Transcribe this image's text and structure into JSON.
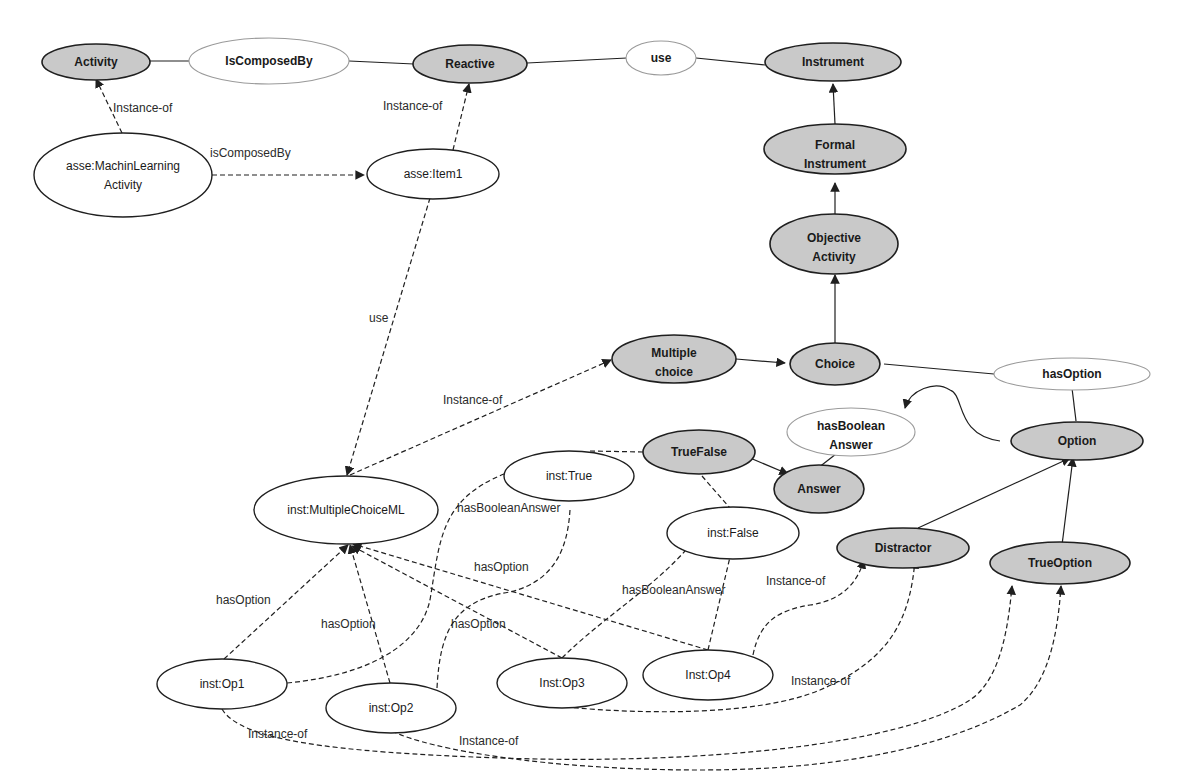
{
  "colors": {
    "class_fill": "#c9c9c9",
    "stroke": "#1f1f1f",
    "relation_stroke": "#9a9a9a"
  },
  "nodes": {
    "activity": {
      "kind": "class",
      "lines": [
        "Activity"
      ]
    },
    "is_composed_by_rel": {
      "kind": "relation",
      "lines": [
        "IsComposedBy"
      ]
    },
    "reactive": {
      "kind": "class",
      "lines": [
        "Reactive"
      ]
    },
    "use_rel": {
      "kind": "relation",
      "lines": [
        "use"
      ]
    },
    "instrument": {
      "kind": "class",
      "lines": [
        "Instrument"
      ]
    },
    "formal_instrument": {
      "kind": "class",
      "lines": [
        "Formal",
        "Instrument"
      ]
    },
    "objective_activity": {
      "kind": "class",
      "lines": [
        "Objective",
        "Activity"
      ]
    },
    "multiple_choice": {
      "kind": "class",
      "lines": [
        "Multiple",
        "choice"
      ]
    },
    "choice": {
      "kind": "class",
      "lines": [
        "Choice"
      ]
    },
    "has_option_rel": {
      "kind": "relation",
      "lines": [
        "hasOption"
      ]
    },
    "has_boolean_answer_rel": {
      "kind": "relation",
      "lines": [
        "hasBoolean",
        "Answer"
      ]
    },
    "option": {
      "kind": "class",
      "lines": [
        "Option"
      ]
    },
    "true_false": {
      "kind": "class",
      "lines": [
        "TrueFalse"
      ]
    },
    "answer": {
      "kind": "class",
      "lines": [
        "Answer"
      ]
    },
    "distractor": {
      "kind": "class",
      "lines": [
        "Distractor"
      ]
    },
    "true_option": {
      "kind": "class",
      "lines": [
        "TrueOption"
      ]
    },
    "ml_activity": {
      "kind": "instance",
      "lines": [
        "asse:MachinLearning",
        "Activity"
      ]
    },
    "item1": {
      "kind": "instance",
      "lines": [
        "asse:Item1"
      ]
    },
    "multiple_choice_ml": {
      "kind": "instance",
      "lines": [
        "inst:MultipleChoiceML"
      ]
    },
    "inst_true": {
      "kind": "instance",
      "lines": [
        "inst:True"
      ]
    },
    "inst_false": {
      "kind": "instance",
      "lines": [
        "inst:False"
      ]
    },
    "op1": {
      "kind": "instance",
      "lines": [
        "inst:Op1"
      ]
    },
    "op2": {
      "kind": "instance",
      "lines": [
        "inst:Op2"
      ]
    },
    "op3": {
      "kind": "instance",
      "lines": [
        "Inst:Op3"
      ]
    },
    "op4": {
      "kind": "instance",
      "lines": [
        "Inst:Op4"
      ]
    }
  },
  "edge_labels": {
    "activity_instance_of": "Instance-of",
    "reactive_instance_of": "Instance-of",
    "is_composed_by": "isComposedBy",
    "use": "use",
    "multiple_choice_instance_of": "Instance-of",
    "true_has_boolean_answer": "hasBooleanAnswer",
    "op2_has_option_curve": "hasOption",
    "op1_has_option": "hasOption",
    "op2_has_option": "hasOption",
    "op3_has_option": "hasOption",
    "false_has_boolean_answer": "hasBooleanAnswer",
    "op4_instance_of_distractor": "Instance-of",
    "op3_instance_of_distractor": "Instance-of",
    "op1_instance_of_true_option": "Instance-of",
    "op2_instance_of_true_option": "Instance-of"
  }
}
